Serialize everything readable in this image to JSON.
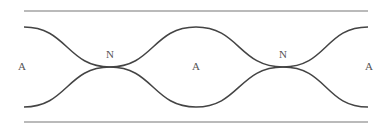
{
  "diagram": {
    "colors": {
      "line": "#444444",
      "boundary": "#777777",
      "text": "#555555"
    },
    "labels": [
      {
        "id": "antinode-left",
        "text": "A",
        "x": 22,
        "y": 70
      },
      {
        "id": "node-1",
        "text": "N",
        "x": 110,
        "y": 58
      },
      {
        "id": "antinode-center",
        "text": "A",
        "x": 196,
        "y": 70
      },
      {
        "id": "node-2",
        "text": "N",
        "x": 283,
        "y": 58
      },
      {
        "id": "antinode-right",
        "text": "A",
        "x": 369,
        "y": 70
      }
    ],
    "boundaries": {
      "top_y": 11,
      "bottom_y": 122,
      "x_start": 24,
      "x_end": 368
    },
    "wave": {
      "x_start": 24,
      "x_end": 368,
      "center_y": 67,
      "amplitude": 40,
      "nodes_x": [
        110,
        283
      ]
    }
  }
}
